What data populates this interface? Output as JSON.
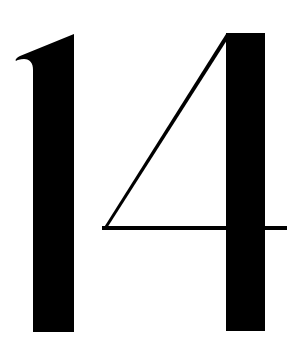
{
  "numeral": {
    "text": "14",
    "color": "#000000",
    "background": "#ffffff"
  },
  "glyphs": [
    {
      "char": "1",
      "label": "digit-one"
    },
    {
      "char": "4",
      "label": "digit-four"
    }
  ]
}
